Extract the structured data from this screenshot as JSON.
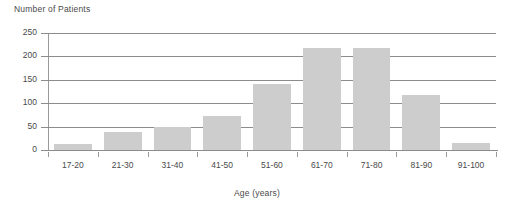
{
  "chart_data": {
    "type": "bar",
    "title": "",
    "ylabel": "Number of Patients",
    "xlabel": "Age (years)",
    "categories": [
      "17-20",
      "21-30",
      "31-40",
      "41-50",
      "51-60",
      "61-70",
      "71-80",
      "81-90",
      "91-100"
    ],
    "values": [
      12,
      38,
      50,
      72,
      142,
      218,
      218,
      118,
      15
    ],
    "ylim": [
      0,
      250
    ],
    "yticks": [
      0,
      50,
      100,
      150,
      200,
      250
    ],
    "ytick_labels": [
      "0",
      "50",
      "100",
      "150",
      "200",
      "250"
    ],
    "grid": "horizontal",
    "legend": "none",
    "bar_color": "#cdcdcd",
    "axis_color": "#8c8c8c",
    "text_color": "#4a4a4a",
    "background": "#ffffff"
  }
}
